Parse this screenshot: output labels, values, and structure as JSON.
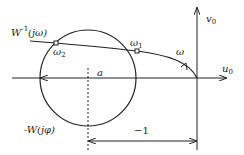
{
  "diagram": {
    "type": "nyquist-circle-criterion",
    "colors": {
      "stroke": "#222222",
      "background": "#ffffff"
    },
    "axes": {
      "vertical": {
        "label_main": "v",
        "label_sub": "0"
      },
      "horizontal": {
        "label_main": "u",
        "label_sub": "0"
      }
    },
    "curve": {
      "label_main": "W",
      "label_sup": "-1",
      "label_rest": "(jω)",
      "direction_label": "ω",
      "points": [
        {
          "main": "ω",
          "sub": "2"
        },
        {
          "main": "ω",
          "sub": "1"
        }
      ]
    },
    "circle": {
      "label": "-W(jφ)"
    },
    "dimensions": {
      "a": "a",
      "minus_one": "−1"
    }
  }
}
